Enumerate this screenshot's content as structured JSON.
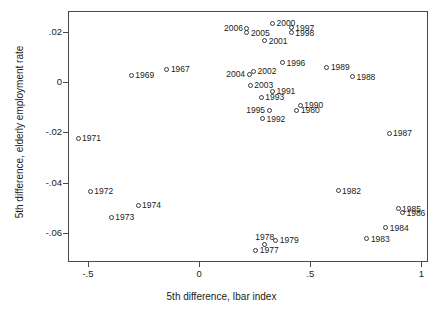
{
  "chart_data": {
    "type": "scatter",
    "title": "",
    "xlabel": "5th difference, Ibar index",
    "ylabel": "5th difference, elderly employment rate",
    "xlim": [
      -0.59,
      1.03
    ],
    "ylim": [
      -0.0715,
      0.0282
    ],
    "xticks": [
      -0.5,
      0,
      0.5,
      1
    ],
    "xticklabels": [
      "-.5",
      "0",
      ".5",
      "1"
    ],
    "yticks": [
      0.02,
      0,
      -0.02,
      -0.04,
      -0.06
    ],
    "yticklabels": [
      ".02",
      "0",
      "-.02",
      "-.04",
      "-.06"
    ],
    "grid": false,
    "legend": null,
    "marker": "open-circle",
    "points": [
      {
        "label": "1967",
        "x": -0.145,
        "y": 0.0051,
        "labelpos": "right"
      },
      {
        "label": "1969",
        "x": -0.305,
        "y": 0.0026,
        "labelpos": "right"
      },
      {
        "label": "1971",
        "x": -0.545,
        "y": -0.0223,
        "labelpos": "right"
      },
      {
        "label": "1972",
        "x": -0.49,
        "y": -0.0434,
        "labelpos": "right"
      },
      {
        "label": "1973",
        "x": -0.395,
        "y": -0.0537,
        "labelpos": "right"
      },
      {
        "label": "1974",
        "x": -0.275,
        "y": -0.049,
        "labelpos": "right"
      },
      {
        "label": "1977",
        "x": 0.255,
        "y": -0.0668,
        "labelpos": "right"
      },
      {
        "label": "1978",
        "x": 0.295,
        "y": -0.0645,
        "labelpos": "above"
      },
      {
        "label": "1979",
        "x": 0.345,
        "y": -0.0629,
        "labelpos": "right"
      },
      {
        "label": "1980",
        "x": 0.44,
        "y": -0.0113,
        "labelpos": "right"
      },
      {
        "label": "1982",
        "x": 0.625,
        "y": -0.0432,
        "labelpos": "right"
      },
      {
        "label": "1983",
        "x": 0.755,
        "y": -0.0622,
        "labelpos": "right"
      },
      {
        "label": "1984",
        "x": 0.84,
        "y": -0.0578,
        "labelpos": "right"
      },
      {
        "label": "1985",
        "x": 0.895,
        "y": -0.0503,
        "labelpos": "right"
      },
      {
        "label": "1986",
        "x": 0.915,
        "y": -0.0519,
        "labelpos": "right"
      },
      {
        "label": "1987",
        "x": 0.855,
        "y": -0.0203,
        "labelpos": "right"
      },
      {
        "label": "1988",
        "x": 0.69,
        "y": 0.0021,
        "labelpos": "right"
      },
      {
        "label": "1989",
        "x": 0.575,
        "y": 0.0058,
        "labelpos": "right"
      },
      {
        "label": "1990",
        "x": 0.455,
        "y": -0.0092,
        "labelpos": "right"
      },
      {
        "label": "1991",
        "x": 0.33,
        "y": -0.0037,
        "labelpos": "right"
      },
      {
        "label": "1992",
        "x": 0.285,
        "y": -0.0146,
        "labelpos": "right"
      },
      {
        "label": "1993",
        "x": 0.28,
        "y": -0.006,
        "labelpos": "right"
      },
      {
        "label": "1995",
        "x": 0.315,
        "y": -0.0112,
        "labelpos": "left"
      },
      {
        "label": "1996",
        "x": 0.375,
        "y": 0.0077,
        "labelpos": "right"
      },
      {
        "label": "1997",
        "x": 0.415,
        "y": 0.0215,
        "labelpos": "right"
      },
      {
        "label": "1998",
        "x": 0.415,
        "y": 0.0196,
        "labelpos": "right"
      },
      {
        "label": "2000",
        "x": 0.33,
        "y": 0.0234,
        "labelpos": "right"
      },
      {
        "label": "2001",
        "x": 0.295,
        "y": 0.0163,
        "labelpos": "right"
      },
      {
        "label": "2002",
        "x": 0.245,
        "y": 0.0043,
        "labelpos": "right"
      },
      {
        "label": "2003",
        "x": 0.23,
        "y": -0.0013,
        "labelpos": "right"
      },
      {
        "label": "2004",
        "x": 0.225,
        "y": 0.003,
        "labelpos": "left"
      },
      {
        "label": "2005",
        "x": 0.215,
        "y": 0.0196,
        "labelpos": "right"
      },
      {
        "label": "2006",
        "x": 0.215,
        "y": 0.0214,
        "labelpos": "left"
      }
    ]
  },
  "axis_color": "#4a4a4a",
  "marker_color": "#3a3a3a",
  "text_color": "#1a1a1a"
}
